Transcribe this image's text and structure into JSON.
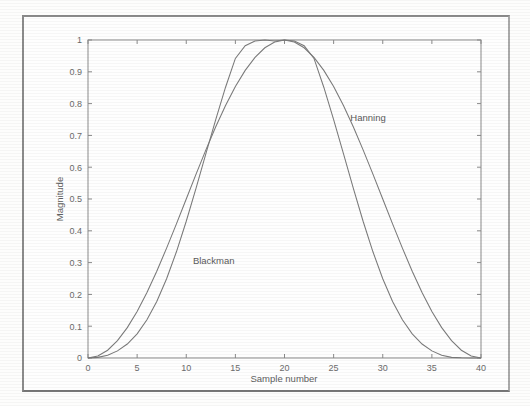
{
  "figure": {
    "frame_color": "#8b8b8b",
    "background": "#fefefe",
    "axis_color": "#8a8a8a",
    "curve_color": "#7a7a7a",
    "text_color": "#6b6b6b"
  },
  "chart_data": {
    "type": "line",
    "title": "",
    "xlabel": "Sample number",
    "ylabel": "Magnitude",
    "xlim": [
      0,
      40
    ],
    "ylim": [
      0,
      1
    ],
    "grid": false,
    "legend_position": "inline-annotation",
    "xticks": [
      0,
      5,
      10,
      15,
      20,
      25,
      30,
      35,
      40
    ],
    "xticklabels": [
      "0",
      "5",
      "10",
      "15",
      "20",
      "25",
      "30",
      "35",
      "40"
    ],
    "yticks": [
      0,
      0.1,
      0.2,
      0.3,
      0.4,
      0.5,
      0.6,
      0.7,
      0.8,
      0.9,
      1
    ],
    "yticklabels": [
      "0",
      "0.1",
      "0.2",
      "0.3",
      "0.4",
      "0.5",
      "0.6",
      "0.7",
      "0.8",
      "0.9",
      "1"
    ],
    "annotations": [
      {
        "text": "Hanning",
        "x": 28.5,
        "y": 0.745
      },
      {
        "text": "Blackman",
        "x": 12.8,
        "y": 0.295
      }
    ],
    "x": [
      0,
      1,
      2,
      3,
      4,
      5,
      6,
      7,
      8,
      9,
      10,
      11,
      12,
      13,
      14,
      15,
      16,
      17,
      18,
      19,
      20,
      21,
      22,
      23,
      24,
      25,
      26,
      27,
      28,
      29,
      30,
      31,
      32,
      33,
      34,
      35,
      36,
      37,
      38,
      39,
      40
    ],
    "series": [
      {
        "name": "Hanning",
        "values": [
          0,
          0.0062,
          0.0245,
          0.0545,
          0.0955,
          0.1464,
          0.2061,
          0.273,
          0.3455,
          0.4218,
          0.5,
          0.5782,
          0.6545,
          0.727,
          0.7939,
          0.8536,
          0.9045,
          0.9455,
          0.9755,
          0.9938,
          1,
          0.9938,
          0.9755,
          0.9455,
          0.9045,
          0.8536,
          0.7939,
          0.727,
          0.6545,
          0.5782,
          0.5,
          0.4218,
          0.3455,
          0.273,
          0.2061,
          0.1464,
          0.0955,
          0.0545,
          0.0245,
          0.0062,
          0
        ]
      },
      {
        "name": "Blackman",
        "values": [
          0,
          0.002,
          0.009,
          0.0223,
          0.044,
          0.076,
          0.1203,
          0.178,
          0.2494,
          0.334,
          0.43,
          0.5341,
          0.6424,
          0.7499,
          0.8515,
          0.9422,
          0.982,
          0.9966,
          1,
          0.9966,
          1,
          0.9966,
          0.982,
          0.9422,
          0.8515,
          0.7499,
          0.6424,
          0.5341,
          0.43,
          0.334,
          0.2494,
          0.178,
          0.1203,
          0.076,
          0.044,
          0.0223,
          0.009,
          0.002,
          0.0006,
          0.0001,
          0
        ]
      }
    ]
  }
}
